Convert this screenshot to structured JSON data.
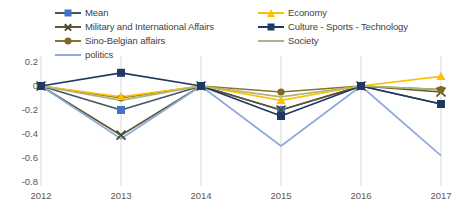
{
  "chart_data": {
    "type": "line",
    "title": "",
    "subtitle": "",
    "xlabel": "",
    "ylabel": "",
    "categories": [
      "2012",
      "2013",
      "2014",
      "2015",
      "2016",
      "2017"
    ],
    "x": [
      2012,
      2013,
      2014,
      2015,
      2016,
      2017
    ],
    "ylim": [
      -0.8,
      0.2
    ],
    "yticks": [
      0.2,
      0,
      -0.2,
      -0.4,
      -0.6,
      -0.8
    ],
    "ytick_labels": [
      "0.2",
      "0",
      "-0.2",
      "-0.4",
      "-0.6",
      "-0.8"
    ],
    "xticks": [
      2012,
      2013,
      2014,
      2015,
      2016,
      2017
    ],
    "grid": true,
    "gridlines": "vertical",
    "legend_position": "top",
    "legend_columns": 2,
    "series": [
      {
        "name": "Mean",
        "color": "#44546a",
        "marker": "square",
        "marker_color": "#4472c4",
        "values": [
          0,
          -0.2,
          0,
          -0.2,
          0,
          -0.15
        ]
      },
      {
        "name": "Military and International Affairs",
        "color": "#5c5a32",
        "marker": "x",
        "marker_color": "#4a4829",
        "values": [
          0,
          -0.41,
          0,
          -0.2,
          0,
          -0.05
        ]
      },
      {
        "name": "Sino-Belgian affairs",
        "color": "#8a7429",
        "marker": "circle",
        "marker_color": "#7f6a24",
        "values": [
          0,
          -0.1,
          0,
          -0.05,
          0,
          -0.03
        ]
      },
      {
        "name": "politics",
        "color": "#8faadc",
        "marker": "none",
        "marker_color": "#8faadc",
        "values": [
          0,
          -0.44,
          0,
          -0.5,
          0,
          -0.58
        ]
      },
      {
        "name": "Economy",
        "color": "#ffc000",
        "marker": "triangle",
        "marker_color": "#ffc000",
        "values": [
          0,
          -0.09,
          0,
          -0.12,
          0,
          0.08
        ]
      },
      {
        "name": "Culture - Sports - Technology",
        "color": "#203864",
        "marker": "square",
        "marker_color": "#1f3864",
        "values": [
          0,
          0.11,
          0,
          -0.25,
          0,
          -0.15
        ]
      },
      {
        "name": "Society",
        "color": "#a9b57a",
        "marker": "none",
        "marker_color": "#a9b57a",
        "values": [
          0,
          -0.12,
          0,
          -0.09,
          0,
          -0.03
        ]
      }
    ]
  },
  "legend": {
    "columns": [
      {
        "entries": [
          {
            "label": "Mean",
            "series_index": 0
          },
          {
            "label": "Military and International Affairs",
            "series_index": 1
          },
          {
            "label": "Sino-Belgian affairs",
            "series_index": 2
          },
          {
            "label": "politics",
            "series_index": 3
          }
        ]
      },
      {
        "entries": [
          {
            "label": "Economy",
            "series_index": 4
          },
          {
            "label": "Culture - Sports - Technology",
            "series_index": 5
          },
          {
            "label": "Society",
            "series_index": 6
          }
        ]
      }
    ]
  },
  "axes": {
    "y_axis_label_color": "#595959",
    "x_axis_label_color": "#595959",
    "gridline_color": "#d9d9d9"
  }
}
